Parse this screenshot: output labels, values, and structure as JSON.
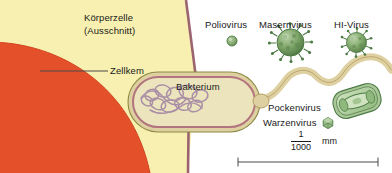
{
  "figure": {
    "type": "scientific-scale-diagram",
    "language": "de",
    "background_color": "#ffffff",
    "width": 392,
    "height": 173
  },
  "labels": {
    "body_cell_line1": "Körperzelle",
    "body_cell_line2": "(Ausschnitt)",
    "nucleus": "Zellkem",
    "bacterium": "Bakterium",
    "poliovirus": "Poliovirus",
    "measles_virus": "Masernvirus",
    "hi_virus": "HI-Virus",
    "pox_virus": "Pockenvirus",
    "wart_virus": "Warzenvirus"
  },
  "scale": {
    "numerator": "1",
    "denominator": "1000",
    "unit": "mm"
  },
  "colors": {
    "cytoplasm": "#f7f0b0",
    "nucleus": "#e4502a",
    "membrane": "#9b6470",
    "bacterium_fill": "#ece4bc",
    "bacterium_wall": "#c2a28f",
    "bacterium_outline": "#8d8a45",
    "dna": "#a98fa6",
    "flagellum": "#ded0a0",
    "flagellum_edge": "#b09a5e",
    "virus_green": "#7aa86a",
    "virus_green_dark": "#4c7a44",
    "virus_pale": "#cfe0bf",
    "rule": "#4a4a4a",
    "text": "#1a1a1a"
  },
  "elements": {
    "nucleus_leader_line": "horizontal leader from nucleus to Zellkem label",
    "virus_shapes": [
      {
        "name": "poliovirus",
        "shape": "small-sphere"
      },
      {
        "name": "measles_virus",
        "shape": "large-spiky-sphere"
      },
      {
        "name": "hi_virus",
        "shape": "medium-spiky-sphere"
      },
      {
        "name": "pox_virus",
        "shape": "brick-oval-with-dumbbell-core"
      },
      {
        "name": "wart_virus",
        "shape": "tiny-icosahedron"
      }
    ]
  }
}
